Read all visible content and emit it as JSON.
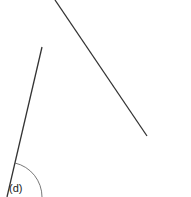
{
  "diagram": {
    "label": "(d)",
    "line_color": "#333333",
    "arc_color": "#555555",
    "lines": [
      {
        "name": "long-line",
        "x1": 55,
        "y1": 0,
        "x2": 147,
        "y2": 136
      },
      {
        "name": "short-line",
        "x1": 42,
        "y1": 47,
        "x2": 7,
        "y2": 197
      }
    ],
    "angle_arc": {
      "cx": 7,
      "cy": 197,
      "r": 35
    }
  }
}
